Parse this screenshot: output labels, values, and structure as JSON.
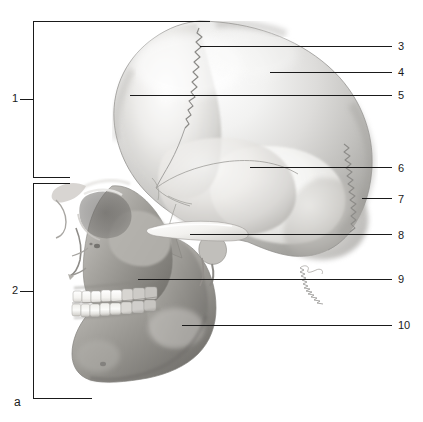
{
  "figure": {
    "panel_label": "a",
    "line_color": "#1a1a1a",
    "background_color": "#ffffff"
  },
  "brackets": [
    {
      "label": "1",
      "region": "neurocranium",
      "label_x": 12,
      "label_y": 92,
      "top_y": 21,
      "bottom_y": 177,
      "spine_x": 33,
      "tick_x": 20,
      "arm_right_x": 210,
      "bottom_arm_right_x": 70
    },
    {
      "label": "2",
      "region": "viscerocranium",
      "label_x": 12,
      "label_y": 282,
      "top_y": 183,
      "bottom_y": 398,
      "spine_x": 33,
      "tick_x": 20,
      "arm_right_x": 70,
      "bottom_arm_right_x": 92
    }
  ],
  "leaders": [
    {
      "label": "3",
      "label_x": 398,
      "label_y": 41,
      "line_y": 46,
      "start_x": 200,
      "end_x": 392
    },
    {
      "label": "4",
      "label_x": 398,
      "label_y": 67,
      "line_y": 72,
      "start_x": 270,
      "end_x": 392
    },
    {
      "label": "5",
      "label_x": 398,
      "label_y": 90,
      "line_y": 95,
      "start_x": 130,
      "end_x": 392
    },
    {
      "label": "6",
      "label_x": 398,
      "label_y": 163,
      "line_y": 167,
      "start_x": 250,
      "end_x": 392
    },
    {
      "label": "7",
      "label_x": 398,
      "label_y": 194,
      "line_y": 198,
      "start_x": 362,
      "end_x": 392
    },
    {
      "label": "8",
      "label_x": 398,
      "label_y": 230,
      "line_y": 234,
      "start_x": 190,
      "end_x": 392
    },
    {
      "label": "9",
      "label_x": 398,
      "label_y": 274,
      "line_y": 279,
      "start_x": 138,
      "end_x": 392
    },
    {
      "label": "10",
      "label_x": 398,
      "label_y": 320,
      "line_y": 325,
      "start_x": 182,
      "end_x": 392
    }
  ]
}
